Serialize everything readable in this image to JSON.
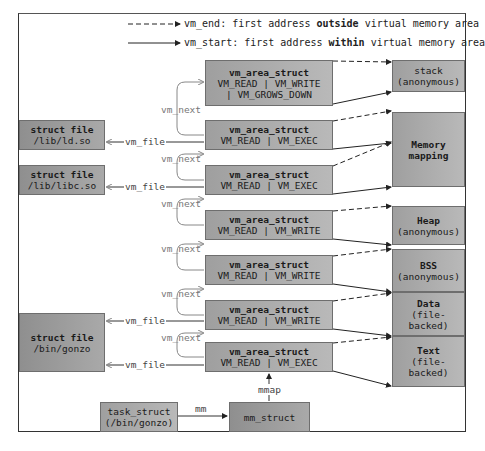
{
  "legend": {
    "dashed": {
      "key": "vm_end",
      "pre": ": first address ",
      "bold": "outside",
      "post": " virtual memory area"
    },
    "solid": {
      "key": "vm_start",
      "pre": ": first address ",
      "bold": "within",
      "post": " virtual memory area"
    }
  },
  "vm_areas": [
    {
      "title": "vm_area_struct",
      "line1": "VM_READ | VM_WRITE",
      "line2": "| VM_GROWS_DOWN"
    },
    {
      "title": "vm_area_struct",
      "line1": "VM_READ | VM_EXEC"
    },
    {
      "title": "vm_area_struct",
      "line1": "VM_READ | VM_EXEC"
    },
    {
      "title": "vm_area_struct",
      "line1": "VM_READ | VM_WRITE"
    },
    {
      "title": "vm_area_struct",
      "line1": "VM_READ | VM_WRITE"
    },
    {
      "title": "vm_area_struct",
      "line1": "VM_READ | VM_WRITE"
    },
    {
      "title": "vm_area_struct",
      "line1": "VM_READ | VM_EXEC"
    }
  ],
  "regions": [
    {
      "title": "stack",
      "sub": "(anonymous)"
    },
    {
      "title": "Memory",
      "sub": "mapping"
    },
    {
      "title": "Heap",
      "sub": "(anonymous)"
    },
    {
      "title": "BSS",
      "sub": "(anonymous)"
    },
    {
      "title": "Data",
      "sub": "(file-",
      "sub2": "backed)"
    },
    {
      "title": "Text",
      "sub": "(file-",
      "sub2": "backed)"
    }
  ],
  "files": [
    {
      "title": "struct file",
      "path": "/lib/ld.so"
    },
    {
      "title": "struct file",
      "path": "/lib/libc.so"
    },
    {
      "title": "struct file",
      "path": "/bin/gonzo"
    }
  ],
  "task": {
    "title": "task_struct",
    "sub": "(/bin/gonzo)"
  },
  "mm": {
    "title": "mm_struct"
  },
  "labels": {
    "vm_next": "vm_next",
    "vm_file": "vm_file",
    "mm": "mm",
    "mmap": "mmap"
  }
}
